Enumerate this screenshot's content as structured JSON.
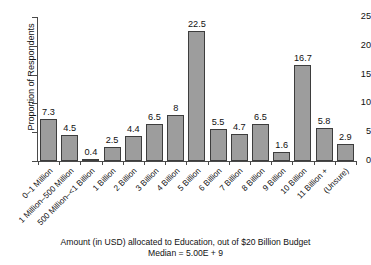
{
  "chart_data": {
    "type": "bar",
    "title": "",
    "xlabel": "Amount (in USD) allocated to Education, out of $20 Billion Budget",
    "ylabel": "Proportion of Respondents",
    "categories": [
      "0–1 Million",
      "1 Million–500 Million",
      "500 Million–<1 Billion",
      "1 Billion",
      "2 Billion",
      "3 Billion",
      "4 Billion",
      "5 Billion",
      "6 Billion",
      "7 Billion",
      "8 Billion",
      "9 Billion",
      "10 Billion",
      "11 Billion +",
      "(Unsure)"
    ],
    "values": [
      7.3,
      4.5,
      0.4,
      2.5,
      4.4,
      6.5,
      8,
      22.5,
      5.5,
      4.7,
      6.5,
      1.6,
      16.7,
      5.8,
      2.9
    ],
    "value_labels": [
      "7.3",
      "4.5",
      "0.4",
      "2.5",
      "4.4",
      "6.5",
      "8",
      "22.5",
      "5.5",
      "4.7",
      "6.5",
      "1.6",
      "16.7",
      "5.8",
      "2.9"
    ],
    "ylim": [
      0,
      25
    ],
    "yticks": [
      0,
      5,
      10,
      15,
      20,
      25
    ],
    "ytick_labels": [
      "0",
      "5",
      "10",
      "15",
      "20",
      "25"
    ],
    "grid": false,
    "legend": false,
    "bar_color": "#9d9d9d",
    "bar_edge_color": "#3d3d3d",
    "axis_color": "#4a4a4a",
    "text_color": "#111111",
    "background": "#ffffff"
  },
  "caption": {
    "line1": "Amount (in USD) allocated to Education, out of $20 Billion Budget",
    "line2": "Median = 5.00E + 9"
  }
}
